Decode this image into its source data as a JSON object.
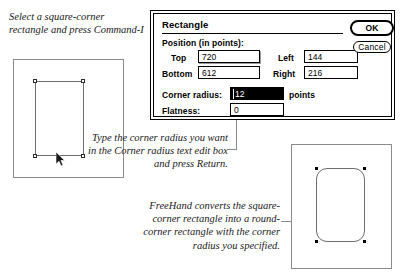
{
  "captions": {
    "select": "Select a square-corner rectangle and press Command-I",
    "type_radius": "Type the corner radius you want in the Corner radius text edit box and press Return.",
    "converts": "FreeHand converts the square-corner rectangle into a round-corner rectangle with the corner radius you specified."
  },
  "dialog": {
    "title": "Rectangle",
    "position_group_label": "Position (in points):",
    "fields": {
      "top_label": "Top",
      "top_value": "720",
      "bottom_label": "Bottom",
      "bottom_value": "612",
      "left_label": "Left",
      "left_value": "144",
      "right_label": "Right",
      "right_value": "216",
      "corner_radius_label": "Corner radius:",
      "corner_radius_value": "12",
      "corner_radius_units": "points",
      "flatness_label": "Flatness:",
      "flatness_value": "0"
    },
    "buttons": {
      "ok": "OK",
      "cancel": "Cancel"
    }
  },
  "illustration": {
    "left_artboard_shape": "square-corner-rectangle",
    "right_artboard_shape": "round-corner-rectangle"
  },
  "colors": {
    "dialog_border": "#000000",
    "artboard_border": "#8b8b8b",
    "shape_stroke": "#6d6d6d",
    "handle_fill": "#000000",
    "selected_field_bg": "#000000",
    "selected_field_text": "#ffffff",
    "leader_line": "#8b8b8b",
    "text": "#1a1a1a"
  }
}
